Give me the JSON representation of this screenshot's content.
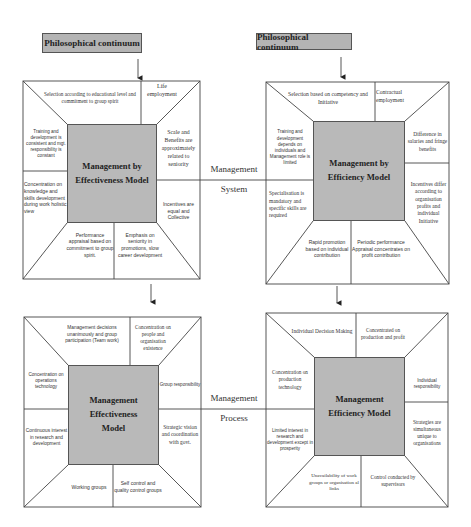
{
  "header_left": {
    "label": "Philosophical continuum"
  },
  "header_right": {
    "label": "Philosophical continuum"
  },
  "connectors": {
    "system": {
      "line1": "Management",
      "line2": "System"
    },
    "process": {
      "line1": "Management",
      "line2": "Process"
    }
  },
  "quad_tl": {
    "core": "Management by Effectiveness Model",
    "top_left": "Selection according to educational level and commitment to group spirit",
    "top_right": "Life employment",
    "left_top": "Training and development is consistent and mgt. responsibility is constant",
    "left_bottom": "Concentration on knowledge and skills development during work holistic view",
    "right_top": "Scale and Benefits are approximately related to seniority",
    "right_bottom": "Incentives are equal and Collective",
    "bottom_left": "Performance appraisal based on commitment to group spirit.",
    "bottom_right": "Emphasis on seniority in promotions, slow career development"
  },
  "quad_tr": {
    "core": "Management by Efficiency Model",
    "top_left": "Selection based on competency and Initiative",
    "top_right": "Contractual employment",
    "left_top": "Training and development depends on individuals and Management role is limited",
    "left_bottom": "Specialisation is mandatory and specific skills are required",
    "right_top": "Difference in salaries and fringe benefits",
    "right_bottom": "Incentives differ according to organisation profits and individual Initiative",
    "bottom_left": "Rapid promotion based on individual contribution",
    "bottom_right": "Periodic performance Appraisal concentrates on profit contribution"
  },
  "quad_bl": {
    "core": "Management Effectiveness Model",
    "top_left": "Management decisions unanimously and group participation (Team work)",
    "top_right": "Concentration on people and organisation existence",
    "left_top": "Concentration on operations technology",
    "left_bottom": "Continuous interest in research and development",
    "right_top": "Group responsibility",
    "right_bottom": "Strategic vision and coordination with govt.",
    "bottom_left": "Working groups",
    "bottom_right": "Self control and quality control groups"
  },
  "quad_br": {
    "core": "Management Efficiency Model",
    "top_left": "Individual Decision Making",
    "top_right": "Concentrated on production and profit",
    "left_top": "Concentration on production technology",
    "left_bottom": "Limited interest in research and development except in prosperity",
    "right_top": "Individual responsibility",
    "right_bottom": "Strategies are simultaneous unique to organisations",
    "bottom_left": "Unavailability of work groups or organisation al links",
    "bottom_right": "Control conducted by supervisors"
  }
}
